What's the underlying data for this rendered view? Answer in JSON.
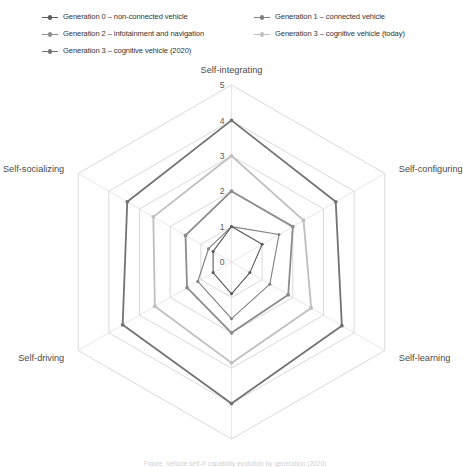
{
  "legend": {
    "items": [
      {
        "label": "Generation 0 – non-connected vehicle",
        "color": "#595959",
        "column": "a"
      },
      {
        "label": "Generation 1 – connected vehicle",
        "color": "#808080",
        "column": "b"
      },
      {
        "label": "Generation 2 – infotainment and navigation",
        "color": "#8c8c8c",
        "column": "a"
      },
      {
        "label": "Generation 3 – cognitive vehicle (today)",
        "color": "#bfbfbf",
        "column": "b"
      },
      {
        "label": "Generation 3 – cognitive vehicle (2020)",
        "color": "#737373",
        "column": "full"
      }
    ]
  },
  "caption": {
    "text": "Figure: Vehicle self-X capability evolution by generation (2020)"
  },
  "chart_data": {
    "type": "radar",
    "title": "",
    "categories": [
      "Self-integrating",
      "Self-configuring",
      "Self-learning",
      "Self-healing",
      "Self-driving",
      "Self-socializing"
    ],
    "rlim": [
      0,
      5
    ],
    "tick_labels": [
      "0",
      "1",
      "2",
      "3",
      "4",
      "5"
    ],
    "tick_values": [
      0,
      1,
      2,
      3,
      4,
      5
    ],
    "grid": true,
    "grid_shape": "polygon",
    "legend_position": "top",
    "series": [
      {
        "name": "Generation 0 – non-connected vehicle",
        "color": "#595959",
        "values": [
          1,
          1,
          0.6,
          0.9,
          0.6,
          0.6
        ]
      },
      {
        "name": "Generation 1 – connected vehicle",
        "color": "#808080",
        "values": [
          1,
          1.55,
          1.25,
          1.6,
          1.1,
          0.75
        ]
      },
      {
        "name": "Generation 2 – infotainment and navigation",
        "color": "#8c8c8c",
        "values": [
          2,
          2,
          1.85,
          2.0,
          1.45,
          1.5
        ]
      },
      {
        "name": "Generation 3 – cognitive vehicle (today)",
        "color": "#bfbfbf",
        "values": [
          3,
          2.35,
          2.6,
          2.85,
          2.5,
          2.55
        ]
      },
      {
        "name": "Generation 3 – cognitive vehicle (2020)",
        "color": "#737373",
        "values": [
          4,
          3.4,
          3.6,
          4.0,
          3.55,
          3.4
        ]
      }
    ]
  }
}
